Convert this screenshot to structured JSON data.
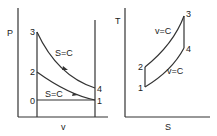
{
  "pv_diagram": {
    "y_axis_label": "P",
    "x_axis_label": "v",
    "points": {
      "p0": "0",
      "p1": "1",
      "p2": "2",
      "p3": "3",
      "p4": "4"
    },
    "curve_upper_label": "S=C",
    "curve_lower_label": "S=C"
  },
  "ts_diagram": {
    "y_axis_label": "T",
    "x_axis_label": "S",
    "points": {
      "p1": "1",
      "p2": "2",
      "p3": "3",
      "p4": "4"
    },
    "curve_upper_label": "v=C",
    "curve_lower_label": "v=C"
  }
}
